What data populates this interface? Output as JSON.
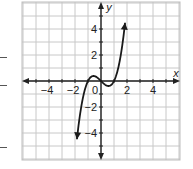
{
  "chart_data": {
    "type": "line",
    "title": "",
    "xlabel": "x",
    "ylabel": "y",
    "xlim": [
      -6,
      6
    ],
    "ylim": [
      -6,
      6
    ],
    "grid": true,
    "x_ticks": [
      -4,
      -2,
      2,
      4
    ],
    "y_ticks": [
      -4,
      -2,
      2,
      4
    ],
    "origin_label": "0",
    "series": [
      {
        "name": "cubic",
        "description": "y = x^3 - x (approx.), arrows at both ends",
        "x": [
          -1.85,
          -1.5,
          -1.0,
          -0.58,
          0.0,
          0.58,
          1.0,
          1.5,
          1.85
        ],
        "y": [
          -4.5,
          -1.88,
          0.0,
          0.38,
          0.0,
          -0.38,
          0.0,
          1.88,
          4.5
        ]
      }
    ],
    "legend": null
  },
  "margin_marks": [
    {
      "y": 57
    },
    {
      "y": 85
    },
    {
      "y": 147
    }
  ]
}
